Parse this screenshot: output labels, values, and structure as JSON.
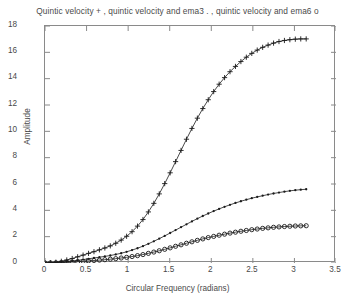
{
  "chart_data": {
    "type": "line",
    "title": "Quintic velocity + , quintic velocity and ema3  . , quintic velocity and ema6  o",
    "xlabel": "Circular Frequency  (radians)",
    "ylabel": "Amplitude",
    "xlim": [
      0,
      3.5
    ],
    "ylim": [
      0,
      18
    ],
    "xticks": [
      "0",
      "0.5",
      "1",
      "1.5",
      "2",
      "2.5",
      "3",
      "3.5"
    ],
    "xtick_values": [
      0,
      0.5,
      1,
      1.5,
      2,
      2.5,
      3,
      3.5
    ],
    "yticks": [
      "0",
      "2",
      "4",
      "6",
      "8",
      "10",
      "12",
      "14",
      "16",
      "18"
    ],
    "ytick_values": [
      0,
      2,
      4,
      6,
      8,
      10,
      12,
      14,
      16,
      18
    ],
    "grid": false,
    "legend_position": "title",
    "line_color": "#1a1a1a",
    "axis_color": "#8a8a8a",
    "background": "#ffffff",
    "x": [
      0,
      0.0654,
      0.1309,
      0.1963,
      0.2618,
      0.3272,
      0.3927,
      0.4581,
      0.5236,
      0.589,
      0.6545,
      0.7199,
      0.7854,
      0.8508,
      0.9163,
      0.9817,
      1.0472,
      1.1126,
      1.1781,
      1.2435,
      1.309,
      1.3744,
      1.4399,
      1.5053,
      1.5708,
      1.6362,
      1.7017,
      1.7671,
      1.8326,
      1.898,
      1.9635,
      2.0289,
      2.0944,
      2.1598,
      2.2253,
      2.2907,
      2.3562,
      2.4216,
      2.4871,
      2.5525,
      2.618,
      2.6834,
      2.7489,
      2.8143,
      2.8798,
      2.9452,
      3.0107,
      3.0761,
      3.1416
    ],
    "series": [
      {
        "name": "Quintic velocity",
        "marker": "+",
        "marker_label": "+",
        "values": [
          0.0,
          0.02,
          0.06,
          0.13,
          0.23,
          0.34,
          0.47,
          0.6,
          0.73,
          0.86,
          1.0,
          1.14,
          1.3,
          1.5,
          1.74,
          2.03,
          2.38,
          2.8,
          3.3,
          3.88,
          4.53,
          5.25,
          6.03,
          6.85,
          7.7,
          8.55,
          9.4,
          10.22,
          11.0,
          11.73,
          12.4,
          13.02,
          13.58,
          14.08,
          14.53,
          14.93,
          15.3,
          15.63,
          15.92,
          16.17,
          16.38,
          16.55,
          16.7,
          16.82,
          16.9,
          16.96,
          17.0,
          17.02,
          17.02
        ]
      },
      {
        "name": "quintic velocity and ema3",
        "marker": ".",
        "marker_label": ".",
        "values": [
          0.0,
          0.01,
          0.03,
          0.06,
          0.1,
          0.15,
          0.2,
          0.26,
          0.32,
          0.38,
          0.44,
          0.5,
          0.57,
          0.65,
          0.74,
          0.85,
          0.98,
          1.12,
          1.28,
          1.46,
          1.65,
          1.85,
          2.06,
          2.28,
          2.5,
          2.72,
          2.94,
          3.16,
          3.37,
          3.57,
          3.76,
          3.94,
          4.11,
          4.27,
          4.42,
          4.56,
          4.69,
          4.81,
          4.92,
          5.02,
          5.11,
          5.2,
          5.28,
          5.35,
          5.42,
          5.48,
          5.53,
          5.57,
          5.6
        ]
      },
      {
        "name": "quintic velocity and ema6",
        "marker": "o",
        "marker_label": "o",
        "values": [
          0.0,
          0.005,
          0.015,
          0.03,
          0.05,
          0.075,
          0.1,
          0.13,
          0.16,
          0.19,
          0.22,
          0.25,
          0.29,
          0.33,
          0.38,
          0.43,
          0.49,
          0.56,
          0.64,
          0.73,
          0.83,
          0.93,
          1.04,
          1.15,
          1.27,
          1.38,
          1.5,
          1.61,
          1.72,
          1.83,
          1.93,
          2.02,
          2.11,
          2.19,
          2.27,
          2.34,
          2.41,
          2.47,
          2.53,
          2.58,
          2.63,
          2.67,
          2.71,
          2.74,
          2.77,
          2.79,
          2.81,
          2.82,
          2.83
        ]
      }
    ]
  }
}
